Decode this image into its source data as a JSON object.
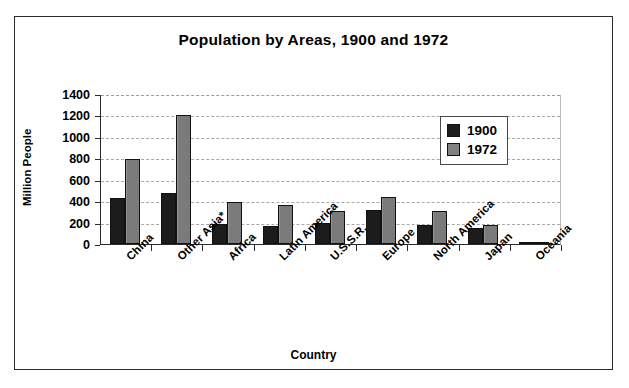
{
  "chart_data": {
    "type": "bar",
    "title": "Population by Areas, 1900 and 1972",
    "xlabel": "Country",
    "ylabel": "Million People",
    "categories": [
      "China",
      "Other Asia*",
      "Africa",
      "Latin America",
      "U.S.S.R.",
      "Europe",
      "North America",
      "Japan",
      "Oceania"
    ],
    "series": [
      {
        "name": "1900",
        "color": "#1c1c1c",
        "values": [
          430,
          480,
          185,
          165,
          195,
          320,
          180,
          150,
          10
        ]
      },
      {
        "name": "1972",
        "color": "#818181",
        "values": [
          790,
          1200,
          395,
          365,
          310,
          440,
          310,
          175,
          20
        ]
      }
    ],
    "ylim": [
      0,
      1400
    ],
    "ytick_labels": [
      "1400",
      "1200",
      "1000",
      "800",
      "600",
      "400",
      "200",
      "0"
    ],
    "ytick_values": [
      1400,
      1200,
      1000,
      800,
      600,
      400,
      200,
      0
    ],
    "grid": true,
    "legend_position": "top-right"
  },
  "legend": {
    "items": [
      {
        "label": "1900"
      },
      {
        "label": "1972"
      }
    ]
  }
}
